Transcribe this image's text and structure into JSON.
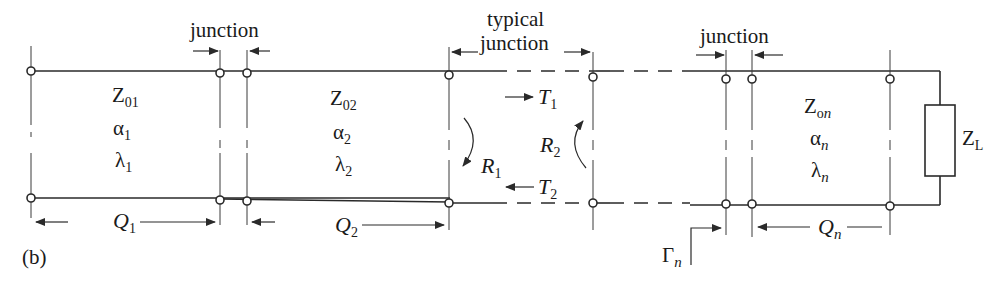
{
  "figure": {
    "panel_label": "(b)",
    "colors": {
      "line": "#2a2a2a",
      "background": "#ffffff"
    }
  },
  "annotations": {
    "junction_left": "junction",
    "typical_junction_line1": "typical",
    "typical_junction_line2": "junction",
    "junction_right": "junction"
  },
  "sections": [
    {
      "id": 1,
      "Z": "Z",
      "Z_sub": "01",
      "alpha": "α",
      "alpha_sub": "1",
      "lambda": "λ",
      "lambda_sub": "1",
      "length": "Q",
      "length_sub": "1"
    },
    {
      "id": 2,
      "Z": "Z",
      "Z_sub": "02",
      "alpha": "α",
      "alpha_sub": "2",
      "lambda": "λ",
      "lambda_sub": "2",
      "length": "Q",
      "length_sub": "2"
    },
    {
      "id": "n",
      "Z": "Z",
      "Z_sub_o": "o",
      "Z_sub_n": "n",
      "alpha": "α",
      "alpha_sub": "n",
      "lambda": "λ",
      "lambda_sub": "n",
      "length": "Q",
      "length_sub": "n"
    }
  ],
  "junction_waves": {
    "T1": {
      "sym": "T",
      "sub": "1"
    },
    "T2": {
      "sym": "T",
      "sub": "2"
    },
    "R1": {
      "sym": "R",
      "sub": "1"
    },
    "R2": {
      "sym": "R",
      "sub": "2"
    }
  },
  "load": {
    "sym": "Z",
    "sub": "L"
  },
  "reflection": {
    "sym": "Γ",
    "sub": "n"
  }
}
